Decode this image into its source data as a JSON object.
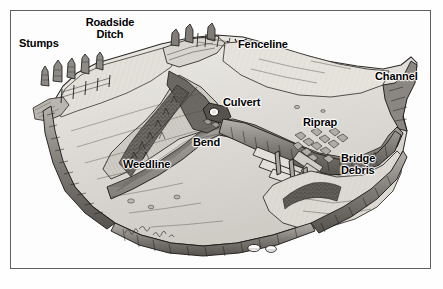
{
  "illustration": {
    "title": "Reservoir Bottom Structure",
    "description": "Grayscale pen-and-ink cutaway illustration of a drained reservoir basin showing a submerged creek channel and fish-holding structures",
    "medium": "pen-and-ink line drawing with gray wash",
    "signature": "artist signature mark",
    "frame": {
      "border_color": "#5d5f61",
      "background_color": "#fdfdfd"
    },
    "palette": {
      "ink": "#1c1c1c",
      "label_text": "#000000",
      "page_background": "#ffffff",
      "flat_highlight": "#e8e6e1",
      "mid_tone": "#bdbab4",
      "bank_shadow": "#8d8a85",
      "channel_water": "#9a9792",
      "deep_shadow": "#4a4846",
      "culvert_opening": "#ffffff",
      "rock_highlight": "#ffffff"
    },
    "labels": [
      {
        "id": "stumps",
        "text": "Stumps",
        "x": 18,
        "y": 37,
        "align": "left"
      },
      {
        "id": "roadside-ditch",
        "text": "Roadside\nDitch",
        "x": 97,
        "y": 16,
        "align": "center"
      },
      {
        "id": "fenceline",
        "text": "Fenceline",
        "x": 237,
        "y": 38,
        "align": "left"
      },
      {
        "id": "channel",
        "text": "Channel",
        "x": 374,
        "y": 70,
        "align": "left"
      },
      {
        "id": "culvert",
        "text": "Culvert",
        "x": 212,
        "y": 93,
        "align": "left"
      },
      {
        "id": "riprap",
        "text": "Riprap",
        "x": 296,
        "y": 110,
        "align": "left"
      },
      {
        "id": "bend",
        "text": "Bend",
        "x": 186,
        "y": 130,
        "align": "left"
      },
      {
        "id": "weedline",
        "text": "Weedline",
        "x": 118,
        "y": 153,
        "align": "left"
      },
      {
        "id": "bridge-debris",
        "text": "Bridge\nDebris",
        "x": 339,
        "y": 148,
        "align": "left"
      }
    ],
    "features": [
      "tree stumps along left bank",
      "wooden fence posts on upper left flat",
      "roadside ditch cut through upper bank",
      "fence line with leader pointer at upper right",
      "white culvert pipe opening",
      "creek channel bend",
      "weedline brush along channel edge",
      "riprap rock armoring",
      "collapsed bridge timbers and debris",
      "main channel notch at right edge",
      "white boulders at lower edge"
    ]
  }
}
